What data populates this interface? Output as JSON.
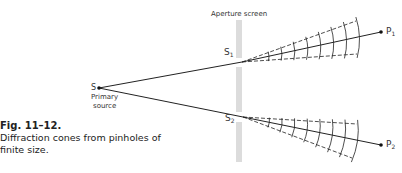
{
  "diagram": {
    "screen_label": "Aperture screen",
    "source": {
      "label": "S",
      "caption_line1": "Primary",
      "caption_line2": "source",
      "x": 99,
      "y": 88
    },
    "pinholes": [
      {
        "label": "S",
        "sub": "1",
        "x": 242,
        "y": 62
      },
      {
        "label": "S",
        "sub": "2",
        "x": 243,
        "y": 117
      }
    ],
    "points": [
      {
        "label": "P",
        "sub": "1",
        "x": 381,
        "y": 32
      },
      {
        "label": "P",
        "sub": "2",
        "x": 381,
        "y": 145
      }
    ],
    "cones": [
      {
        "apex": [
          242,
          62
        ],
        "upper_end": [
          356,
          21
        ],
        "lower_end": [
          357,
          54
        ],
        "arcs": 8
      },
      {
        "apex": [
          243,
          117
        ],
        "upper_end": [
          357,
          124
        ],
        "lower_end": [
          352,
          158
        ],
        "arcs": 8
      }
    ],
    "colors": {
      "line": "#222222",
      "screen": "#d9d9d9",
      "text": "#333333"
    }
  },
  "caption": {
    "title": "Fig. 11–12.",
    "line1": "Diffraction cones from pinholes of",
    "line2": "finite size."
  }
}
